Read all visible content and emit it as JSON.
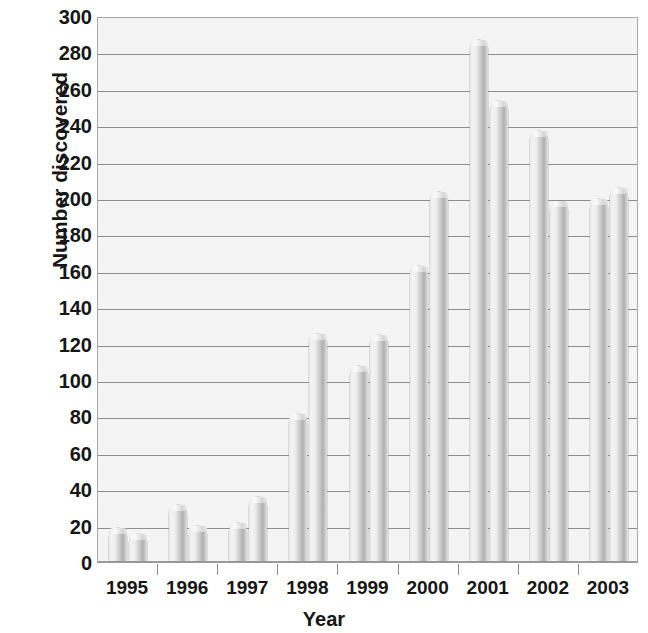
{
  "chart_data": {
    "type": "bar",
    "title": "",
    "xlabel": "Year",
    "ylabel": "Number discovered",
    "categories": [
      "1995",
      "1996",
      "1997",
      "1998",
      "1999",
      "2000",
      "2001",
      "2002",
      "2003"
    ],
    "bars_per_category": 2,
    "series": [
      {
        "name": "first half",
        "values": [
          18,
          31,
          21,
          81,
          107,
          162,
          286,
          236,
          199
        ]
      },
      {
        "name": "second half",
        "values": [
          15,
          19,
          35,
          125,
          124,
          203,
          253,
          198,
          205
        ]
      }
    ],
    "values_in_plot_order": [
      18,
      15,
      31,
      19,
      21,
      35,
      81,
      125,
      107,
      124,
      162,
      203,
      286,
      253,
      236,
      198,
      199,
      205
    ],
    "ylim": [
      0,
      300
    ],
    "ytick_step": 20,
    "yticks": [
      0,
      20,
      40,
      60,
      80,
      100,
      120,
      140,
      160,
      180,
      200,
      220,
      240,
      260,
      280,
      300
    ],
    "grid": "horizontal",
    "legend": "none",
    "bar_style": "cylinder",
    "colors": {
      "plot_background": "#f4f4f4",
      "gridline": "#8e8e8e",
      "axis": "#9a9a9a",
      "bar_light": "#f4f4f4",
      "bar_dark": "#b0b0b0",
      "text": "#161616"
    }
  }
}
